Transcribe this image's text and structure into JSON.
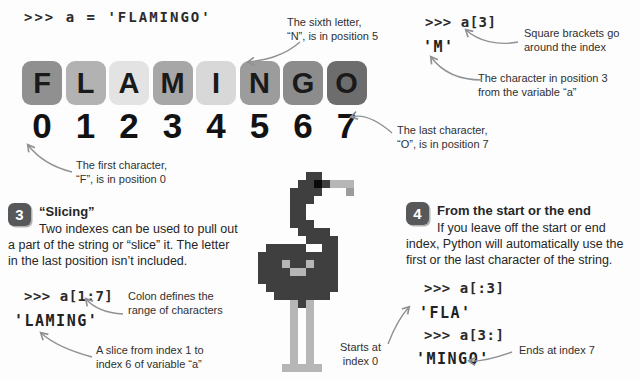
{
  "header": {
    "code_assignment": ">>> a = 'FLAMINGO'"
  },
  "index_example": {
    "code": ">>> a[3]",
    "result": "'M'"
  },
  "annotations": {
    "sixth_letter": "The sixth letter,\n“N”, is in position 5",
    "square_brackets": "Square brackets go\naround the index",
    "position_3": "The character in position 3\nfrom the variable “a”",
    "last_char": "The last character,\n“O”, is in position 7",
    "first_char": "The first character,\n“F”, is in position 0",
    "colon": "Colon defines the\nrange of characters",
    "slice_range": "A slice from index 1 to\nindex 6 of variable “a”",
    "starts_at": "Starts at\nindex 0",
    "ends_at": "Ends at index 7"
  },
  "tiles": [
    {
      "letter": "F",
      "index": "0",
      "color": "#909090"
    },
    {
      "letter": "L",
      "index": "1",
      "color": "#b2b2b2"
    },
    {
      "letter": "A",
      "index": "2",
      "color": "#e3e3e3"
    },
    {
      "letter": "M",
      "index": "3",
      "color": "#a7a7a7"
    },
    {
      "letter": "I",
      "index": "4",
      "color": "#d8d8d8"
    },
    {
      "letter": "N",
      "index": "5",
      "color": "#9c9c9c"
    },
    {
      "letter": "G",
      "index": "6",
      "color": "#8c8c8c"
    },
    {
      "letter": "O",
      "index": "7",
      "color": "#6d6d6d"
    }
  ],
  "section3": {
    "number": "3",
    "title": "“Slicing”",
    "body": "Two indexes can be used to pull out a part of the string or “slice” it. The letter in the last position isn’t included.",
    "code": ">>> a[1:7]",
    "result": "'LAMING'"
  },
  "section4": {
    "number": "4",
    "title": "From the start or the end",
    "body": "If you leave off the start or end index, Python will automatically use the first or the last character of the string.",
    "code_start": ">>> a[:3]",
    "result_start": "'FLA'",
    "code_end": ">>> a[3:]",
    "result_end": "'MINGO'"
  },
  "flamingo": {
    "palette": {
      "D": "#3f3f3f",
      "B": "#0a0a0a",
      "L": "#b6b6b6",
      "M": "#9c9c9c"
    },
    "grid": [
      "......DD........",
      ".....DDBDLLL....",
      "....DDDD...M....",
      "....DDD.........",
      "....DD..........",
      "....DD..........",
      "....DDD.........",
      ".....DDDD.......",
      "......DDDD......",
      ".DDDDD..DD......",
      "DDDDDDDDDD......",
      "DDDLDDLDDD......",
      "DDDDLLDDDD......",
      "DDDDDDDDDD......",
      ".DDDDDDDDD......",
      "..DDDDDDD.......",
      "....LDL.........",
      "....L.L.........",
      "....L.L.........",
      "....L.L.........",
      "....L.L.........",
      "....L.L.........",
      "....L.L.........",
      "....L.L.........",
      "...LLLLL........"
    ]
  },
  "colors": {
    "arrow": "#8f9194",
    "badge_bg": "#57585a",
    "badge_text": "#ffffff",
    "background": "#fdfdfd"
  }
}
